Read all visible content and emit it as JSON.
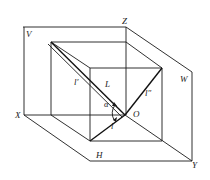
{
  "diagram": {
    "labels": {
      "V": "V",
      "Z": "Z",
      "W": "W",
      "X": "X",
      "H": "H",
      "Y": "Y",
      "O": "O",
      "L": "L",
      "l_prime": "l′",
      "l_double_prime": "l″",
      "l": "l",
      "alpha": "α"
    },
    "colors": {
      "line": "#1a1a1a",
      "background": "#ffffff"
    }
  }
}
